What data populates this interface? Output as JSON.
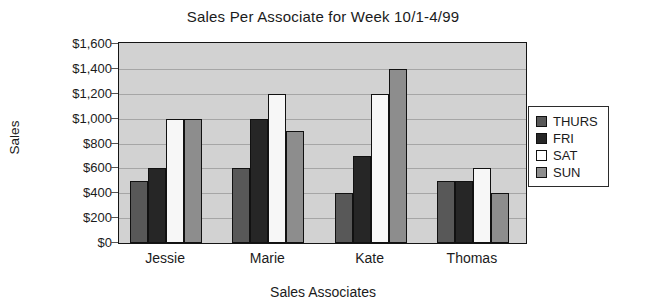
{
  "chart_data": {
    "type": "bar",
    "title": "Sales Per Associate for Week 10/1-4/99",
    "xlabel": "Sales Associates",
    "ylabel": "Sales",
    "categories": [
      "Jessie",
      "Marie",
      "Kate",
      "Thomas"
    ],
    "series": [
      {
        "name": "THURS",
        "color": "#585858",
        "values": [
          500,
          600,
          400,
          500
        ]
      },
      {
        "name": "FRI",
        "color": "#262626",
        "values": [
          600,
          1000,
          700,
          500
        ]
      },
      {
        "name": "SAT",
        "color": "#ffffff",
        "values": [
          1000,
          1200,
          1200,
          600
        ]
      },
      {
        "name": "SUN",
        "color": "#8d8d8d",
        "values": [
          1000,
          900,
          1400,
          400
        ]
      }
    ],
    "ylim": [
      0,
      1600
    ],
    "ytick_values": [
      0,
      200,
      400,
      600,
      800,
      1000,
      1200,
      1400,
      1600
    ],
    "ytick_labels": [
      "$0",
      "$200",
      "$400",
      "$600",
      "$800",
      "$1,000",
      "$1,200",
      "$1,400",
      "$1,600"
    ],
    "grid": true,
    "legend_position": "right",
    "plot_background": "#d2d2d2",
    "figure_background": "#ffffff"
  }
}
